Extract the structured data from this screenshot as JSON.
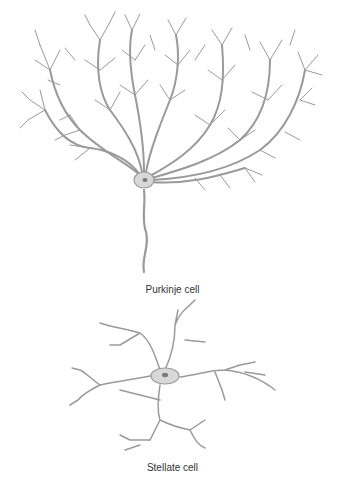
{
  "figure": {
    "panels": [
      {
        "id": "purkinje",
        "label": "Purkinje cell"
      },
      {
        "id": "stellate",
        "label": "Stellate cell"
      }
    ],
    "colors": {
      "line": "#9a9a9a",
      "soma": "#d8d8d8",
      "nucleus": "#7a7a7a",
      "label": "#333333",
      "background": "#ffffff"
    }
  }
}
